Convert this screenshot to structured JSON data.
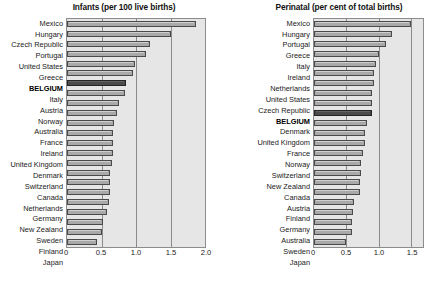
{
  "figure": {
    "panels": [
      {
        "id": "infants",
        "title": "Infants (per 100 live births)"
      },
      {
        "id": "perinatal",
        "title": "Perinatal (per cent of total births)"
      }
    ]
  },
  "colors": {
    "plot_background": "#e6e6e6",
    "bar_fill": "#a9a9a9",
    "bar_border": "#4a4a4a",
    "highlight_fill": "#4b4b4b",
    "gridline": "#8a8a8a",
    "text": "#1a1a1a"
  },
  "highlight_category": "BELGIUM",
  "chart_data": [
    {
      "type": "bar",
      "orientation": "horizontal",
      "title": "Infants (per 100 live births)",
      "xlabel": "",
      "ylabel": "",
      "xlim": [
        0,
        2.0
      ],
      "xticks": [
        0,
        0.5,
        1.0,
        1.5,
        2.0
      ],
      "xtick_labels": [
        "0",
        "0.5",
        "1.0",
        "1.5",
        "2.0"
      ],
      "grid": true,
      "legend": "none",
      "highlight": "BELGIUM",
      "categories": [
        "Mexico",
        "Hungary",
        "Czech Republic",
        "Portugal",
        "United States",
        "Greece",
        "BELGIUM",
        "Italy",
        "Austria",
        "Norway",
        "Australia",
        "France",
        "Ireland",
        "United Kingdom",
        "Denmark",
        "Switzerland",
        "Canada",
        "Netherlands",
        "Germany",
        "New Zealand",
        "Sweden",
        "Finland",
        "Japan"
      ],
      "values": [
        1.87,
        1.5,
        1.2,
        1.15,
        0.99,
        0.95,
        0.85,
        0.84,
        0.76,
        0.72,
        0.68,
        0.67,
        0.66,
        0.66,
        0.65,
        0.63,
        0.62,
        0.62,
        0.61,
        0.58,
        0.52,
        0.51,
        0.44
      ]
    },
    {
      "type": "bar",
      "orientation": "horizontal",
      "title": "Perinatal (per cent of total births)",
      "xlabel": "",
      "ylabel": "",
      "xlim": [
        0,
        1.68
      ],
      "xticks": [
        0,
        0.5,
        1.0,
        1.5
      ],
      "xtick_labels": [
        "0",
        "0.5",
        "1.0",
        "1.5"
      ],
      "grid": true,
      "legend": "none",
      "highlight": "BELGIUM",
      "categories": [
        "Mexico",
        "Hungary",
        "Portugal",
        "Greece",
        "Italy",
        "Ireland",
        "Netherlands",
        "United States",
        "Czech Republic",
        "BELGIUM",
        "Denmark",
        "United Kingdom",
        "France",
        "Norway",
        "Switzerland",
        "New Zealand",
        "Canada",
        "Austria",
        "Finland",
        "Germany",
        "Australia",
        "Sweden",
        "Japan"
      ],
      "values": [
        1.49,
        1.2,
        1.11,
        1.0,
        0.96,
        0.93,
        0.93,
        0.9,
        0.89,
        0.89,
        0.82,
        0.79,
        0.79,
        0.76,
        0.72,
        0.72,
        0.71,
        0.71,
        0.61,
        0.6,
        0.58,
        0.58,
        0.5
      ]
    }
  ]
}
